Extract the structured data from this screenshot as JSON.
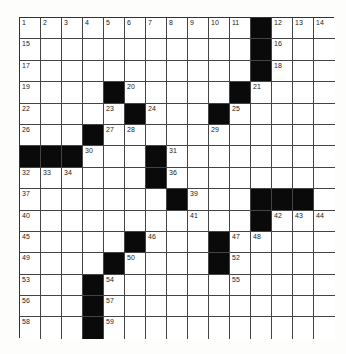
{
  "puzzle": {
    "rows": 15,
    "cols": 15,
    "grid": [
      "...........#...",
      "...........#...",
      "...........#...",
      "....#.....#....",
      ".....#...#.....",
      "...#...........",
      "###...#........",
      "......#........",
      ".......#...###.",
      "...........#...",
      ".....#...#.....",
      "....#....#.....",
      "...#...........",
      "...#...........",
      "...#..........."
    ],
    "numbers": [
      {
        "r": 0,
        "c": 0,
        "n": 1
      },
      {
        "r": 0,
        "c": 1,
        "n": 2
      },
      {
        "r": 0,
        "c": 2,
        "n": 3
      },
      {
        "r": 0,
        "c": 3,
        "n": 4
      },
      {
        "r": 0,
        "c": 4,
        "n": 5
      },
      {
        "r": 0,
        "c": 5,
        "n": 6
      },
      {
        "r": 0,
        "c": 6,
        "n": 7
      },
      {
        "r": 0,
        "c": 7,
        "n": 8
      },
      {
        "r": 0,
        "c": 8,
        "n": 9
      },
      {
        "r": 0,
        "c": 9,
        "n": 10
      },
      {
        "r": 0,
        "c": 10,
        "n": 11
      },
      {
        "r": 0,
        "c": 12,
        "n": 12
      },
      {
        "r": 0,
        "c": 13,
        "n": 13
      },
      {
        "r": 0,
        "c": 14,
        "n": 14
      },
      {
        "r": 1,
        "c": 0,
        "n": 15
      },
      {
        "r": 1,
        "c": 12,
        "n": 16
      },
      {
        "r": 2,
        "c": 0,
        "n": 17
      },
      {
        "r": 2,
        "c": 12,
        "n": 18
      },
      {
        "r": 3,
        "c": 0,
        "n": 19
      },
      {
        "r": 3,
        "c": 5,
        "n": 20
      },
      {
        "r": 3,
        "c": 11,
        "n": 21
      },
      {
        "r": 4,
        "c": 0,
        "n": 22
      },
      {
        "r": 4,
        "c": 4,
        "n": 23
      },
      {
        "r": 4,
        "c": 6,
        "n": 24
      },
      {
        "r": 4,
        "c": 10,
        "n": 25
      },
      {
        "r": 5,
        "c": 0,
        "n": 26
      },
      {
        "r": 5,
        "c": 4,
        "n": 27
      },
      {
        "r": 5,
        "c": 5,
        "n": 28
      },
      {
        "r": 5,
        "c": 9,
        "n": 29
      },
      {
        "r": 6,
        "c": 3,
        "n": 30
      },
      {
        "r": 6,
        "c": 7,
        "n": 31
      },
      {
        "r": 7,
        "c": 0,
        "n": 32
      },
      {
        "r": 7,
        "c": 1,
        "n": 33
      },
      {
        "r": 7,
        "c": 2,
        "n": 34
      },
      {
        "r": 7,
        "c": 6,
        "n": 35
      },
      {
        "r": 7,
        "c": 7,
        "n": 36
      },
      {
        "r": 8,
        "c": 0,
        "n": 37
      },
      {
        "r": 8,
        "c": 7,
        "n": 38
      },
      {
        "r": 8,
        "c": 8,
        "n": 39
      },
      {
        "r": 9,
        "c": 0,
        "n": 40
      },
      {
        "r": 9,
        "c": 8,
        "n": 41
      },
      {
        "r": 9,
        "c": 12,
        "n": 42
      },
      {
        "r": 9,
        "c": 13,
        "n": 43
      },
      {
        "r": 9,
        "c": 14,
        "n": 44
      },
      {
        "r": 10,
        "c": 0,
        "n": 45
      },
      {
        "r": 10,
        "c": 6,
        "n": 46
      },
      {
        "r": 10,
        "c": 10,
        "n": 47
      },
      {
        "r": 10,
        "c": 11,
        "n": 48
      },
      {
        "r": 11,
        "c": 0,
        "n": 49
      },
      {
        "r": 11,
        "c": 5,
        "n": 50
      },
      {
        "r": 11,
        "c": 9,
        "n": 51
      },
      {
        "r": 11,
        "c": 10,
        "n": 52
      },
      {
        "r": 12,
        "c": 0,
        "n": 53
      },
      {
        "r": 12,
        "c": 4,
        "n": 54
      },
      {
        "r": 12,
        "c": 10,
        "n": 55
      },
      {
        "r": 13,
        "c": 0,
        "n": 56
      },
      {
        "r": 13,
        "c": 4,
        "n": 57
      },
      {
        "r": 14,
        "c": 0,
        "n": 58
      },
      {
        "r": 14,
        "c": 4,
        "n": 59
      }
    ],
    "colors": {
      "black_square": "#0a0a0a",
      "white_square": "#ffffff",
      "grid_line": "#444444"
    }
  }
}
